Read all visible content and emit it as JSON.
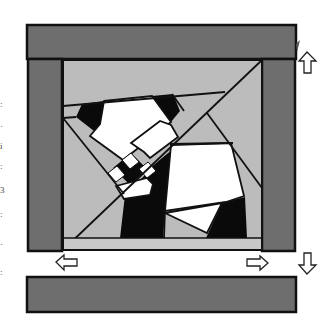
{
  "diagram": {
    "colors": {
      "border_dark": "#6e6e6e",
      "background_light": "#bcbcbc",
      "black": "#0a0a0a",
      "white": "#ffffff",
      "outline": "#111111"
    },
    "pieces": {
      "top_border": "Top border strip",
      "bottom_border": "Bottom border strip",
      "left_border": "Left border strip",
      "right_border": "Right border strip",
      "center_block": "Center pieced block"
    },
    "arrows": [
      {
        "name": "press-up-arrow",
        "direction": "up"
      },
      {
        "name": "press-left-arrow",
        "direction": "left"
      },
      {
        "name": "press-right-arrow",
        "direction": "right"
      },
      {
        "name": "press-down-arrow",
        "direction": "down"
      }
    ]
  },
  "margin_fragments": [
    ":",
    "·",
    "i",
    ":",
    "3",
    ":",
    "·",
    ":"
  ]
}
